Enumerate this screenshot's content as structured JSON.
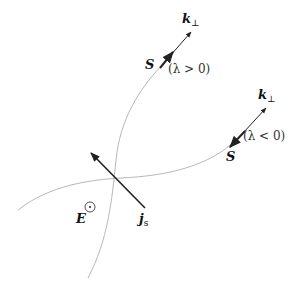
{
  "diagram": {
    "labels": {
      "k_perp_top": {
        "main": "k",
        "sub": "⊥"
      },
      "S_top": "S",
      "lambda_pos": "(λ > 0)",
      "k_perp_right": {
        "main": "k",
        "sub": "⊥"
      },
      "S_right": "S",
      "lambda_neg": "(λ < 0)",
      "E_field": "E",
      "current": {
        "main": "j",
        "sub": "s"
      }
    },
    "symbols": {
      "E_direction": "out-of-page (⊙)"
    },
    "colors": {
      "curve": "#b8b8b8",
      "arrow": "#222222",
      "text": "#111111"
    }
  }
}
